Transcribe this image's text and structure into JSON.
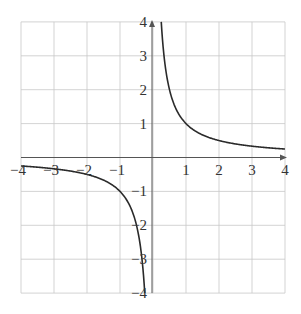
{
  "chart_data": {
    "type": "line",
    "title": "",
    "xlabel": "",
    "ylabel": "",
    "function": "y = 1/x",
    "xlim": [
      -4,
      4
    ],
    "ylim": [
      -4,
      4
    ],
    "grid": true,
    "legend": null,
    "x_ticks": [
      -4,
      -3,
      -2,
      -1,
      1,
      2,
      3,
      4
    ],
    "y_ticks": [
      -4,
      -3,
      -2,
      -1,
      1,
      2,
      3,
      4
    ],
    "x_tick_labels": [
      "−4",
      "−3",
      "−2",
      "−1",
      "1",
      "2",
      "3",
      "4"
    ],
    "y_tick_labels": [
      "−4",
      "−3",
      "−2",
      "−1",
      "1",
      "2",
      "3",
      "4"
    ],
    "series": [
      {
        "name": "1/x (x<0)",
        "x": [
          -4,
          -3,
          -2,
          -1.5,
          -1,
          -0.75,
          -0.5,
          -0.4,
          -0.3,
          -0.25
        ],
        "y": [
          -0.25,
          -0.333,
          -0.5,
          -0.667,
          -1,
          -1.333,
          -2,
          -2.5,
          -3.333,
          -4
        ]
      },
      {
        "name": "1/x (x>0)",
        "x": [
          0.25,
          0.3,
          0.4,
          0.5,
          0.75,
          1,
          1.5,
          2,
          3,
          4
        ],
        "y": [
          4,
          3.333,
          2.5,
          2,
          1.333,
          1,
          0.667,
          0.5,
          0.333,
          0.25
        ]
      }
    ],
    "colors": {
      "curve": "#2a2a2a",
      "grid": "#c8c8c8",
      "axis": "#555555",
      "labels": "#333333"
    }
  }
}
